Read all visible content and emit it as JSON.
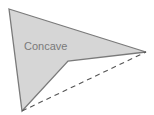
{
  "diagram": {
    "shape_label": "Concave",
    "colors": {
      "fill": "#d6d6d6",
      "stroke": "#7a7a7a",
      "dashed": "#555555",
      "label": "#7a7a7a"
    },
    "vertices": [
      [
        9,
        9
      ],
      [
        146,
        52
      ],
      [
        68,
        61
      ],
      [
        22,
        111
      ]
    ],
    "dashed_segment": [
      [
        22,
        111
      ],
      [
        146,
        52
      ]
    ]
  }
}
